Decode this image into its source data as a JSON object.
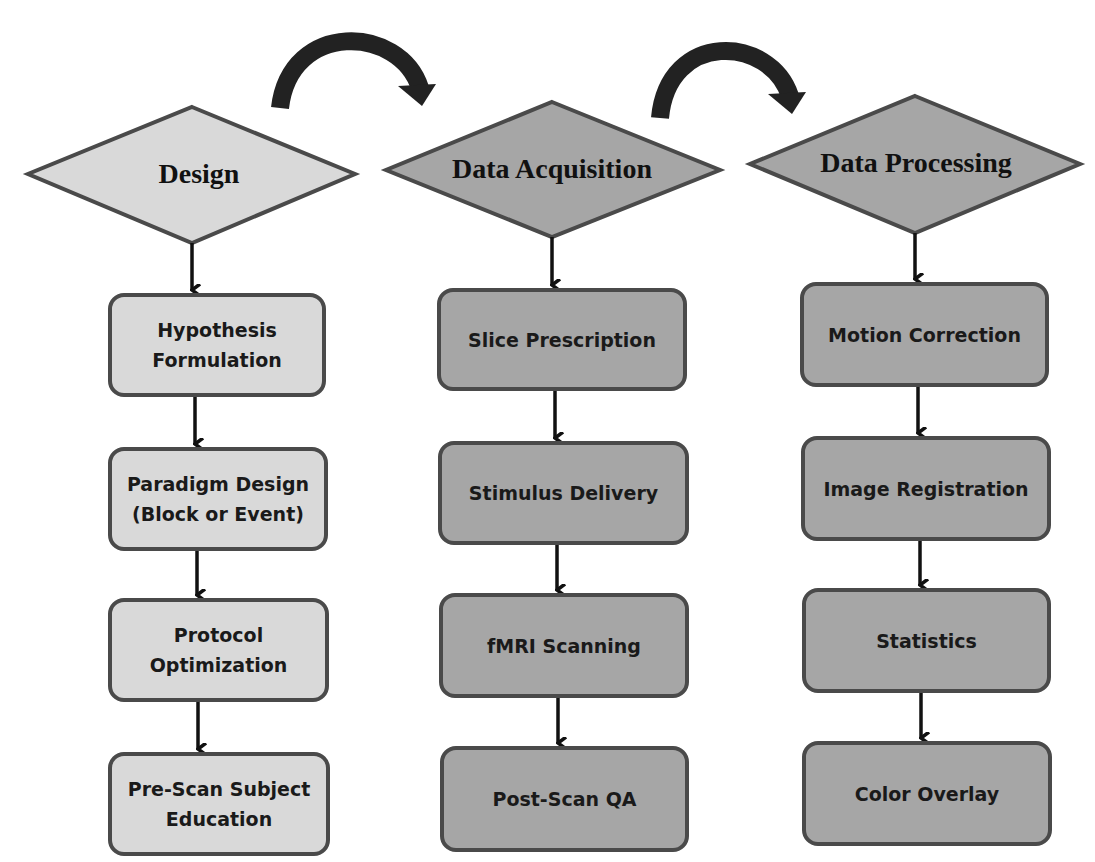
{
  "colors": {
    "design_fill": "#d9d9d9",
    "acquisition_fill": "#a6a6a6",
    "processing_fill": "#a6a6a6",
    "border": "#4a4a4a",
    "arrow": "#222222"
  },
  "phases": [
    {
      "title": "Design",
      "steps": [
        [
          "Hypothesis",
          "Formulation"
        ],
        [
          "Paradigm Design",
          "(Block or Event)"
        ],
        [
          "Protocol",
          "Optimization"
        ],
        [
          "Pre-Scan Subject",
          "Education"
        ]
      ]
    },
    {
      "title": "Data Acquisition",
      "steps": [
        [
          "Slice Prescription"
        ],
        [
          "Stimulus Delivery"
        ],
        [
          "fMRI Scanning"
        ],
        [
          "Post-Scan QA"
        ]
      ]
    },
    {
      "title": "Data Processing",
      "steps": [
        [
          "Motion Correction"
        ],
        [
          "Image Registration"
        ],
        [
          "Statistics"
        ],
        [
          "Color Overlay"
        ]
      ]
    }
  ],
  "transitions": [
    {
      "from": "Design",
      "to": "Data Acquisition",
      "icon": "curved-arrow-icon"
    },
    {
      "from": "Data Acquisition",
      "to": "Data Processing",
      "icon": "curved-arrow-icon"
    }
  ]
}
